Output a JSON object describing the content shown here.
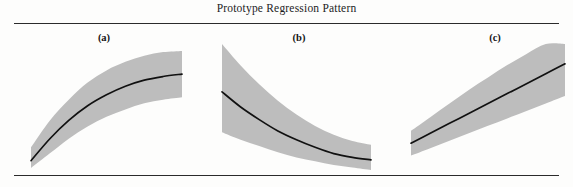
{
  "figure": {
    "title": "Prototype Regression Pattern",
    "band_color": "#bdbdbd",
    "curve_color": "#111111",
    "rule_color": "#2b2b2b",
    "background_color": "#fdfdfc"
  },
  "panels": [
    {
      "label": "(a)",
      "pattern": "concave-increasing"
    },
    {
      "label": "(b)",
      "pattern": "convex-decreasing"
    },
    {
      "label": "(c)",
      "pattern": "linear-increasing"
    }
  ],
  "chart_data": {
    "type": "line",
    "title": "Prototype Regression Pattern",
    "xlabel": "",
    "ylabel": "",
    "grid": false,
    "legend": "none",
    "band_color": "#bdbdbd",
    "curve_color": "#111111",
    "note": "Three prototype regression shapes, each drawn as a fitted trend line inside a shaded confidence band. Values are normalised 0-1 in x and y (y increases upward).",
    "charts": [
      {
        "panel": "(a)",
        "label": "(a)",
        "type": "line",
        "shape": "concave-down increasing (logarithmic / saturating)",
        "xlim": [
          0,
          1
        ],
        "ylim": [
          0,
          1
        ],
        "x": [
          0.0,
          0.125,
          0.25,
          0.375,
          0.5,
          0.625,
          0.75,
          0.875,
          1.0
        ],
        "fit": [
          0.06,
          0.24,
          0.39,
          0.51,
          0.6,
          0.67,
          0.72,
          0.75,
          0.77
        ],
        "upper": [
          0.17,
          0.39,
          0.56,
          0.7,
          0.8,
          0.87,
          0.92,
          0.95,
          0.96
        ],
        "lower": [
          0.0,
          0.12,
          0.24,
          0.34,
          0.42,
          0.48,
          0.53,
          0.56,
          0.58
        ],
        "band_width_trend": "widens toward the right"
      },
      {
        "panel": "(b)",
        "label": "(b)",
        "type": "line",
        "shape": "convex decreasing (exponential decay)",
        "xlim": [
          0,
          1
        ],
        "ylim": [
          0,
          1
        ],
        "x": [
          0.0,
          0.125,
          0.25,
          0.375,
          0.5,
          0.625,
          0.75,
          0.875,
          1.0
        ],
        "fit": [
          0.62,
          0.5,
          0.4,
          0.31,
          0.24,
          0.18,
          0.13,
          0.1,
          0.08
        ],
        "upper": [
          1.0,
          0.83,
          0.68,
          0.55,
          0.44,
          0.35,
          0.28,
          0.23,
          0.2
        ],
        "lower": [
          0.3,
          0.24,
          0.19,
          0.14,
          0.1,
          0.07,
          0.04,
          0.02,
          0.0
        ],
        "band_width_trend": "very wide at the left, narrows toward the right"
      },
      {
        "panel": "(c)",
        "label": "(c)",
        "type": "line",
        "shape": "linear increasing",
        "xlim": [
          0,
          1
        ],
        "ylim": [
          0,
          1
        ],
        "x": [
          0.0,
          0.125,
          0.25,
          0.375,
          0.5,
          0.625,
          0.75,
          0.875,
          1.0
        ],
        "fit": [
          0.2,
          0.28,
          0.36,
          0.44,
          0.52,
          0.6,
          0.68,
          0.76,
          0.84
        ],
        "upper": [
          0.3,
          0.41,
          0.52,
          0.63,
          0.73,
          0.83,
          0.92,
          1.0,
          1.0
        ],
        "lower": [
          0.1,
          0.16,
          0.22,
          0.28,
          0.34,
          0.4,
          0.46,
          0.52,
          0.58
        ],
        "band_width_trend": "fans out toward the right"
      }
    ]
  }
}
